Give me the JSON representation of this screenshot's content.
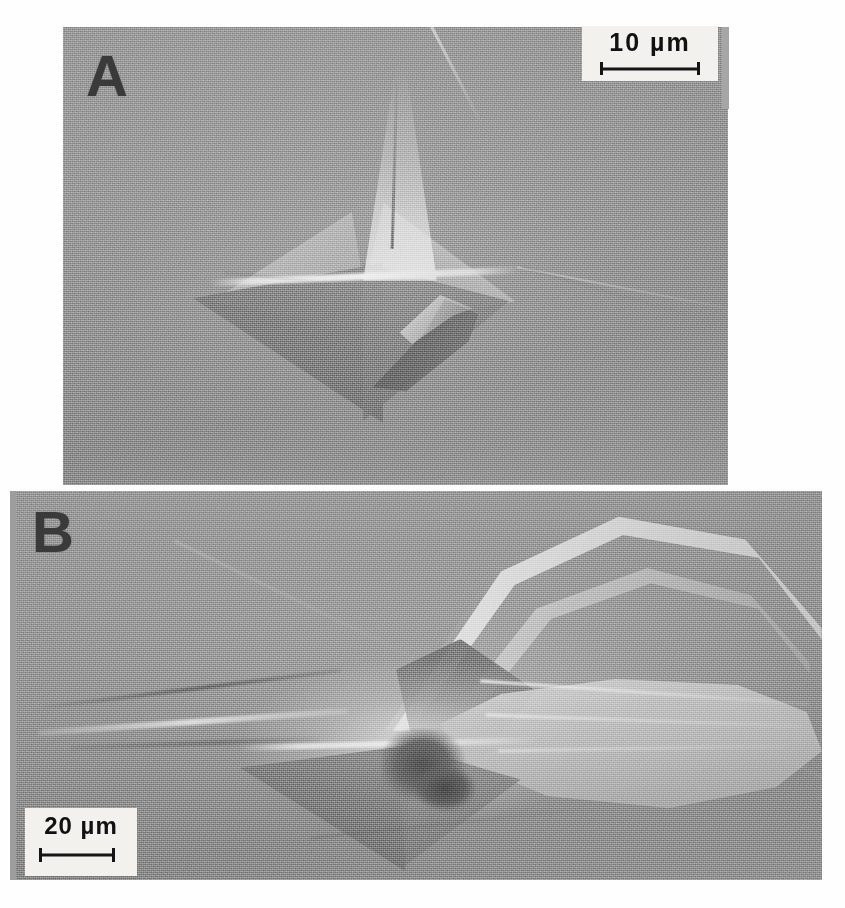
{
  "figure": {
    "type": "sem-micrograph-figure",
    "background_color": "#ffffff",
    "panel_count": 2
  },
  "panels": [
    {
      "id": "A",
      "letter": "A",
      "letter_color": "#3a3a3a",
      "micrograph_color": "#9a9a9a",
      "position": {
        "x": 63,
        "y": 27,
        "width": 665,
        "height": 458
      },
      "scalebar": {
        "label": "10 µm",
        "value": 10,
        "unit": "µm",
        "box_color": "#f3f1ee",
        "bar_color": "#151515",
        "position": "top-right"
      },
      "content_description": "Vickers pyramidal indentation with radial crack and dark sickle-shaped chip"
    },
    {
      "id": "B",
      "letter": "B",
      "letter_color": "#3a3a3a",
      "micrograph_color": "#989898",
      "position": {
        "x": 10,
        "y": 491,
        "width": 812,
        "height": 389
      },
      "scalebar": {
        "label": "20 µm",
        "value": 20,
        "unit": "µm",
        "box_color": "#f3f1ee",
        "bar_color": "#151515",
        "position": "bottom-left"
      },
      "content_description": "Larger pyramidal indentation with extensive lateral cracking and spalled delamination lobes"
    }
  ]
}
